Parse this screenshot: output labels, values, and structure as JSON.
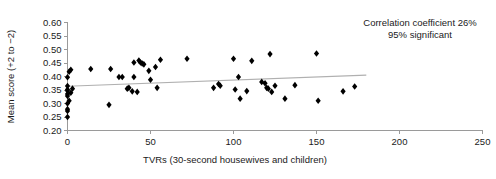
{
  "chart_data": {
    "type": "scatter",
    "title": "",
    "xlabel": "TVRs (30-second housewives and children)",
    "ylabel": "Mean score (+2 to −2)",
    "xlim": [
      0,
      250
    ],
    "ylim": [
      0.2,
      0.6
    ],
    "xticks": [
      0,
      50,
      100,
      150,
      200,
      250
    ],
    "xtick_labels": [
      "0",
      "50",
      "100",
      "150",
      "200",
      "250"
    ],
    "yticks": [
      0.2,
      0.25,
      0.3,
      0.35,
      0.4,
      0.45,
      0.5,
      0.55,
      0.6
    ],
    "ytick_labels": [
      "0.20",
      "0.25",
      "0.30",
      "0.35",
      "0.40",
      "0.45",
      "0.50",
      "0.55",
      "0.60"
    ],
    "grid": false,
    "legend": "none",
    "marker": "diamond",
    "marker_color": "#000000",
    "annotations": [
      "Correlation coefficient 26%",
      "95% significant"
    ],
    "trendline": {
      "x_start": 0,
      "y_start": 0.364,
      "x_end": 180,
      "y_end": 0.405,
      "color": "#b0b0b0"
    },
    "points": [
      [
        0,
        0.25
      ],
      [
        0,
        0.272
      ],
      [
        0,
        0.279
      ],
      [
        0,
        0.3
      ],
      [
        1,
        0.31
      ],
      [
        0,
        0.328
      ],
      [
        0,
        0.335
      ],
      [
        0,
        0.347
      ],
      [
        2,
        0.34
      ],
      [
        0,
        0.352
      ],
      [
        3,
        0.355
      ],
      [
        0,
        0.365
      ],
      [
        0,
        0.397
      ],
      [
        1,
        0.418
      ],
      [
        2,
        0.425
      ],
      [
        14,
        0.428
      ],
      [
        25,
        0.295
      ],
      [
        26,
        0.428
      ],
      [
        31,
        0.398
      ],
      [
        33,
        0.398
      ],
      [
        36,
        0.355
      ],
      [
        37,
        0.358
      ],
      [
        39,
        0.345
      ],
      [
        40,
        0.398
      ],
      [
        40,
        0.452
      ],
      [
        42,
        0.343
      ],
      [
        43,
        0.459
      ],
      [
        44,
        0.452
      ],
      [
        45,
        0.448
      ],
      [
        46,
        0.445
      ],
      [
        49,
        0.421
      ],
      [
        50,
        0.388
      ],
      [
        53,
        0.435
      ],
      [
        54,
        0.358
      ],
      [
        56,
        0.462
      ],
      [
        72,
        0.466
      ],
      [
        88,
        0.358
      ],
      [
        91,
        0.372
      ],
      [
        92,
        0.366
      ],
      [
        100,
        0.466
      ],
      [
        101,
        0.352
      ],
      [
        103,
        0.398
      ],
      [
        104,
        0.318
      ],
      [
        108,
        0.346
      ],
      [
        111,
        0.458
      ],
      [
        117,
        0.38
      ],
      [
        119,
        0.375
      ],
      [
        120,
        0.358
      ],
      [
        121,
        0.355
      ],
      [
        122,
        0.483
      ],
      [
        123,
        0.343
      ],
      [
        125,
        0.366
      ],
      [
        131,
        0.318
      ],
      [
        137,
        0.368
      ],
      [
        150,
        0.485
      ],
      [
        151,
        0.31
      ],
      [
        166,
        0.345
      ],
      [
        173,
        0.363
      ]
    ]
  }
}
